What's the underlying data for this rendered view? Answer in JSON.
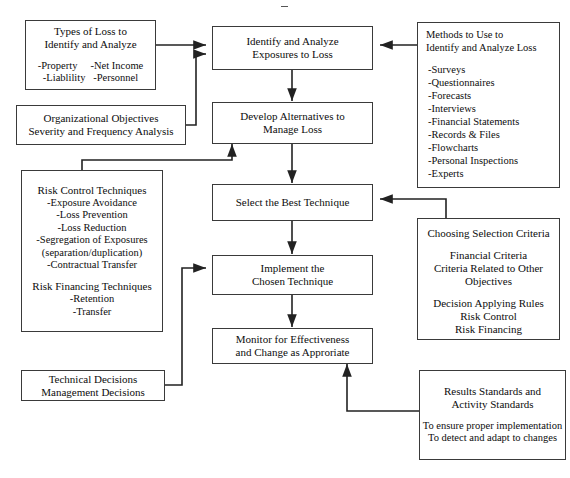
{
  "diagram": {
    "line_color": "#222222",
    "box_border_color": "#3a3a3a",
    "background": "#ffffff"
  },
  "process_steps": [
    {
      "id": "identify",
      "lines": [
        "Identify and Analyze",
        "Exposures to Loss"
      ]
    },
    {
      "id": "develop",
      "lines": [
        "Develop Alternatives to",
        "Manage Loss"
      ]
    },
    {
      "id": "select",
      "lines": [
        "Select the Best Technique"
      ]
    },
    {
      "id": "implement",
      "lines": [
        "Implement the",
        "Chosen Technique"
      ]
    },
    {
      "id": "monitor",
      "lines": [
        "Monitor for Effectiveness",
        "and Change as Approriate"
      ]
    }
  ],
  "types_of_loss": {
    "heading": [
      "Types of Loss to",
      "Identify and Analyze"
    ],
    "items": [
      "-Property     -Net Income",
      "-Liablility   -Personnel"
    ]
  },
  "organizational_objectives": {
    "lines": [
      "Organizational Objectives",
      "Severity and Frequency Analysis"
    ]
  },
  "risk_techniques": {
    "control_heading": "Risk Control Techniques",
    "control_items": [
      "-Exposure Avoidance",
      "-Loss Prevention",
      "-Loss Reduction",
      "-Segregation of Exposures",
      "(separation/duplication)",
      "-Contractual Transfer"
    ],
    "financing_heading": "Risk Financing Techniques",
    "financing_items": [
      "-Retention",
      "-Transfer"
    ]
  },
  "decisions": {
    "lines": [
      "Technical Decisions",
      "Management Decisions"
    ]
  },
  "methods": {
    "heading": [
      "Methods to Use to",
      "Identify and Analyze Loss"
    ],
    "items": [
      "-Surveys",
      "-Questionnaires",
      "-Forecasts",
      "-Interviews",
      "-Financial Statements",
      "-Records & Files",
      "-Flowcharts",
      "-Personal Inspections",
      "-Experts"
    ]
  },
  "selection_criteria": {
    "heading": "Choosing Selection Criteria",
    "group_one": [
      "Financial Criteria",
      "Criteria Related to Other",
      "Objectives"
    ],
    "group_two": [
      "Decision Applying Rules",
      "Risk Control",
      "Risk Financing"
    ]
  },
  "standards": {
    "heading": [
      "Results Standards and",
      "Activity Standards"
    ],
    "details": [
      "To ensure proper implementation",
      "To detect and adapt to changes"
    ]
  }
}
